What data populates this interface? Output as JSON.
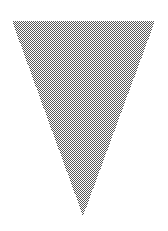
{
  "canvas": {
    "width": 168,
    "height": 231,
    "background_color": "#ffffff",
    "title": "Downward-pointing triangle"
  },
  "shape": {
    "name": "inverted-triangle",
    "kind": "triangle",
    "orientation": "pointing-down",
    "fill_style": "checkerboard-dither",
    "fill_dark_color": "#565656",
    "fill_light_color": "#ffffff",
    "fill_average_color": "#9a9a9a",
    "dither_cell_px": 1,
    "stroke": "none",
    "vertices": [
      {
        "label": "top-left",
        "x": 12,
        "y": 21
      },
      {
        "label": "top-right",
        "x": 155,
        "y": 21
      },
      {
        "label": "apex-bottom",
        "x": 83,
        "y": 216
      }
    ],
    "points_attr": "12,21 155,21 83,216",
    "top_edge_y": 21,
    "apex_y": 216,
    "width_px": 143,
    "height_px": 195
  }
}
